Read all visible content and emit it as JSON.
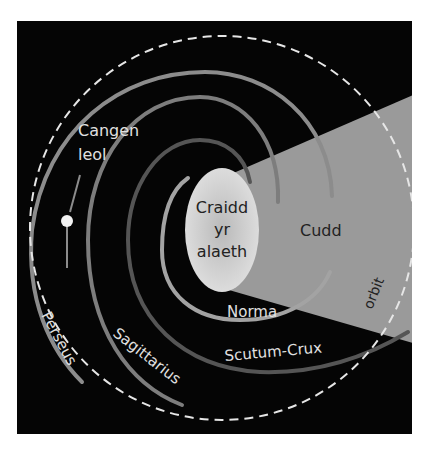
{
  "colors": {
    "background": "#ffffff",
    "space": "#050505",
    "cone": "#9a9a9a",
    "core": "#d9d9d9",
    "core_center": "#bdbdbd",
    "orbit": "#e6e6e6",
    "perseus": "#8c8c8c",
    "sagittarius": "#7d7d7d",
    "scutum_crux": "#555555",
    "norma": "#a3a3a3",
    "sun": "#f2f2f2",
    "label_light": "#e0e0e0",
    "label_dark": "#222222"
  },
  "labels": {
    "sun": "Cangen",
    "sun_line2": "leol",
    "core_line1": "Craidd",
    "core_line2": "yr",
    "core_line3": "alaeth",
    "hidden_zone": "Cudd",
    "norma": "Norma",
    "scutum_crux": "Scutum-Crux",
    "sagittarius": "Sagittarius",
    "perseus": "Perseus",
    "orbit": "orbit"
  }
}
